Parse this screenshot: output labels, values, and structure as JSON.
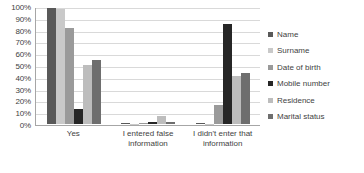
{
  "chart_data": {
    "type": "bar",
    "title": "",
    "subtitle": "",
    "xlabel": "",
    "ylabel": "",
    "ylim": [
      0,
      100
    ],
    "y_unit": "%",
    "grid": true,
    "legend_position": "right",
    "orientation": "vertical",
    "grouping": "grouped",
    "categories": [
      "Yes",
      "I entered false information",
      "I didn't enter that information"
    ],
    "y_ticks": [
      "0%",
      "10%",
      "20%",
      "30%",
      "40%",
      "50%",
      "60%",
      "70%",
      "80%",
      "90%",
      "100%"
    ],
    "y_tick_values": [
      0,
      10,
      20,
      30,
      40,
      50,
      60,
      70,
      80,
      90,
      100
    ],
    "series": [
      {
        "name": "Name",
        "color": "#595959",
        "values": [
          99,
          0.5,
          0.8
        ]
      },
      {
        "name": "Surname",
        "color": "#c9c9c9",
        "values": [
          98,
          0.4,
          0.3
        ]
      },
      {
        "name": "Date of birth",
        "color": "#9a9a9a",
        "values": [
          82,
          0.6,
          16.5
        ]
      },
      {
        "name": "Mobile number",
        "color": "#262626",
        "values": [
          12.5,
          2.0,
          85.5
        ]
      },
      {
        "name": "Residence",
        "color": "#bdbdbd",
        "values": [
          50.5,
          7.0,
          41.0
        ]
      },
      {
        "name": "Marital status",
        "color": "#6e6e6e",
        "values": [
          55.0,
          1.8,
          43.5
        ]
      }
    ]
  },
  "legend": {
    "items": [
      {
        "label": "Name"
      },
      {
        "label": "Surname"
      },
      {
        "label": "Date of birth"
      },
      {
        "label": "Mobile number"
      },
      {
        "label": "Residence"
      },
      {
        "label": "Marital status"
      }
    ]
  }
}
